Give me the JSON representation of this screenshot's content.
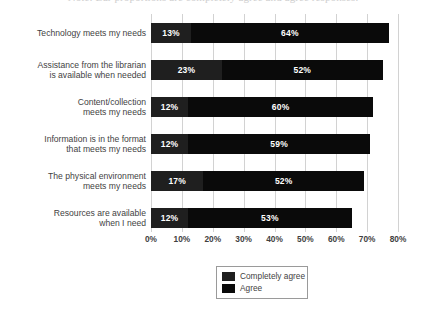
{
  "caption": {
    "text": "Note: Bar proportions are completely agree and agree responses."
  },
  "chart_data": {
    "type": "bar",
    "orientation": "horizontal",
    "stacked": true,
    "title": "",
    "subtitle": "",
    "xlabel": "",
    "ylabel": "",
    "xlim": [
      0,
      80
    ],
    "xtick_labels": [
      "0%",
      "10%",
      "20%",
      "30%",
      "40%",
      "50%",
      "60%",
      "70%",
      "80%"
    ],
    "xtick_values": [
      0,
      10,
      20,
      30,
      40,
      50,
      60,
      70,
      80
    ],
    "grid": true,
    "grid_axis": "x",
    "legend_position": "bottom",
    "categories": [
      "Technology meets my needs",
      "Assistance from the librarian is available when needed",
      "Content/collection meets my needs",
      "Information is in the format that meets my needs",
      "The physical environment meets my needs",
      "Resources are available when I need"
    ],
    "category_lines": [
      [
        "Technology meets my needs"
      ],
      [
        "Assistance from the librarian",
        "is available when needed"
      ],
      [
        "Content/collection",
        "meets my needs"
      ],
      [
        "Information is in the format",
        "that meets my needs"
      ],
      [
        "The physical environment",
        "meets my needs"
      ],
      [
        "Resources are available",
        "when I need"
      ]
    ],
    "series": [
      {
        "name": "Completely agree",
        "color": "#1f1f1f",
        "values": [
          13,
          23,
          12,
          12,
          17,
          12
        ],
        "labels": [
          "13%",
          "23%",
          "12%",
          "12%",
          "17%",
          "12%"
        ]
      },
      {
        "name": "Agree",
        "color": "#0a0a0a",
        "values": [
          64,
          52,
          60,
          59,
          52,
          53
        ],
        "labels": [
          "64%",
          "52%",
          "60%",
          "59%",
          "52%",
          "53%"
        ]
      }
    ],
    "totals": [
      77,
      75,
      72,
      71,
      69,
      65
    ]
  },
  "legend": {
    "entries": [
      {
        "label": "Completely agree",
        "color": "#1f1f1f"
      },
      {
        "label": "Agree",
        "color": "#0a0a0a"
      }
    ]
  },
  "colors": {
    "background": "#ffffff",
    "gridline": "#d2d2d2",
    "text": "#3f3f3f",
    "series_1": "#1f1f1f",
    "series_2": "#0a0a0a",
    "legend_border": "#9a9a9a",
    "data_label": "#ffffff"
  }
}
